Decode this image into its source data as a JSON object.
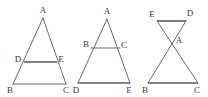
{
  "sheet": {
    "width": 208,
    "height": 97,
    "background": "#ffffff",
    "line_color": "#6b6b6b",
    "heavy_line_color": "#5a5a5a",
    "label_color": "#3a3a3a"
  },
  "figures": [
    {
      "id": "figure-1",
      "description": "triangle with midsegment",
      "labels": {
        "apex": "A",
        "left_mid": "D",
        "right_mid": "E",
        "bottom_left": "B",
        "bottom_right": "C"
      },
      "points": {
        "A": [
          43,
          18
        ],
        "D": [
          24,
          62
        ],
        "E": [
          57,
          62
        ],
        "B": [
          13,
          84
        ],
        "C": [
          66,
          84
        ]
      },
      "label_positions": {
        "A": [
          43,
          11
        ],
        "D": [
          18,
          60
        ],
        "E": [
          61,
          60
        ],
        "B": [
          10,
          91
        ],
        "C": [
          66,
          91
        ]
      }
    },
    {
      "id": "figure-2",
      "description": "triangle with upper crossbar",
      "labels": {
        "apex": "A",
        "left_mid": "B",
        "right_mid": "C",
        "bottom_left": "D",
        "bottom_right": "E"
      },
      "points": {
        "A": [
          107,
          19
        ],
        "B": [
          91,
          48
        ],
        "C": [
          120,
          48
        ],
        "D": [
          78,
          83
        ],
        "E": [
          130,
          83
        ]
      },
      "label_positions": {
        "A": [
          107,
          12
        ],
        "B": [
          86,
          45
        ],
        "C": [
          124,
          46
        ],
        "D": [
          76,
          91
        ],
        "E": [
          129,
          91
        ]
      }
    },
    {
      "id": "figure-3",
      "description": "bowtie with small top triangle and large bottom triangle",
      "labels": {
        "crossing": "A",
        "top_left": "E",
        "top_right": "D",
        "bottom_left": "B",
        "bottom_right": "C"
      },
      "points": {
        "E": [
          157,
          21
        ],
        "D": [
          186,
          21
        ],
        "A": [
          172,
          38
        ],
        "B": [
          148,
          83
        ],
        "C": [
          198,
          83
        ]
      },
      "label_positions": {
        "E": [
          153,
          15
        ],
        "D": [
          189,
          14
        ],
        "A": [
          178,
          41
        ],
        "B": [
          145,
          91
        ],
        "C": [
          197,
          91
        ]
      }
    }
  ]
}
